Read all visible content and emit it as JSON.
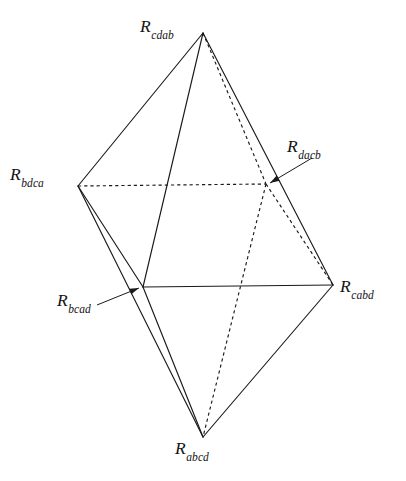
{
  "figure": {
    "type": "diagram",
    "subtype": "polyhedron-wireframe",
    "background_color": "#ffffff",
    "line_color": "#1a1a1a",
    "canvas": {
      "width": 406,
      "height": 481
    }
  },
  "vertices": [
    {
      "id": "cdab",
      "base": "R",
      "subscript": "cdab",
      "point": {
        "x": 203,
        "y": 33
      },
      "label_position": {
        "x": 140,
        "y": 18
      },
      "has_leader": false
    },
    {
      "id": "bdca",
      "base": "R",
      "subscript": "bdca",
      "point": {
        "x": 78,
        "y": 186
      },
      "label_position": {
        "x": 10,
        "y": 166
      },
      "has_leader": false
    },
    {
      "id": "dacb",
      "base": "R",
      "subscript": "dacb",
      "point": {
        "x": 266,
        "y": 184
      },
      "label_position": {
        "x": 287,
        "y": 138
      },
      "has_leader": true
    },
    {
      "id": "bcad",
      "base": "R",
      "subscript": "bcad",
      "point": {
        "x": 143,
        "y": 287
      },
      "label_position": {
        "x": 57,
        "y": 292
      },
      "has_leader": true
    },
    {
      "id": "cabd",
      "base": "R",
      "subscript": "cabd",
      "point": {
        "x": 333,
        "y": 285
      },
      "label_position": {
        "x": 340,
        "y": 278
      },
      "has_leader": false
    },
    {
      "id": "abcd",
      "base": "R",
      "subscript": "abcd",
      "point": {
        "x": 203,
        "y": 437
      },
      "label_position": {
        "x": 175,
        "y": 440
      },
      "has_leader": false
    }
  ],
  "edges": [
    {
      "from": "cdab",
      "to": "bdca",
      "style": "solid"
    },
    {
      "from": "cdab",
      "to": "bcad",
      "style": "solid"
    },
    {
      "from": "cdab",
      "to": "cabd",
      "style": "solid"
    },
    {
      "from": "cdab",
      "to": "dacb",
      "style": "dashed"
    },
    {
      "from": "bdca",
      "to": "dacb",
      "style": "dashed"
    },
    {
      "from": "bdca",
      "to": "bcad",
      "style": "solid"
    },
    {
      "from": "bdca",
      "to": "abcd",
      "style": "solid"
    },
    {
      "from": "bcad",
      "to": "cabd",
      "style": "solid"
    },
    {
      "from": "bcad",
      "to": "abcd",
      "style": "solid"
    },
    {
      "from": "dacb",
      "to": "cabd",
      "style": "dashed"
    },
    {
      "from": "dacb",
      "to": "abcd",
      "style": "dashed"
    },
    {
      "from": "cabd",
      "to": "abcd",
      "style": "solid"
    }
  ],
  "leaders": [
    {
      "for": "dacb",
      "from": {
        "x": 312,
        "y": 158
      },
      "to": {
        "x": 270,
        "y": 183
      }
    },
    {
      "for": "bcad",
      "from": {
        "x": 97,
        "y": 305
      },
      "to": {
        "x": 139,
        "y": 288
      }
    }
  ]
}
